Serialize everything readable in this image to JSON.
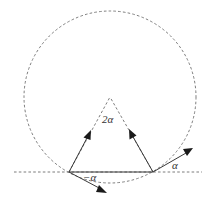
{
  "diagram": {
    "type": "geometry",
    "colors": {
      "dashed": "#6e6e6e",
      "solid": "#3a3a3a",
      "arrowhead": "#1a1a1a"
    },
    "circle": {
      "cx": 110,
      "cy": 97,
      "r": 86
    },
    "baseline": {
      "y": 172,
      "x1": 14,
      "x2": 202
    },
    "chord": {
      "x1": 69,
      "y1": 172,
      "x2": 153,
      "y2": 172
    },
    "apex": {
      "x": 110,
      "y": 97
    },
    "labels": {
      "central_angle": "2α",
      "left_angle": "−α",
      "right_angle": "α"
    }
  }
}
